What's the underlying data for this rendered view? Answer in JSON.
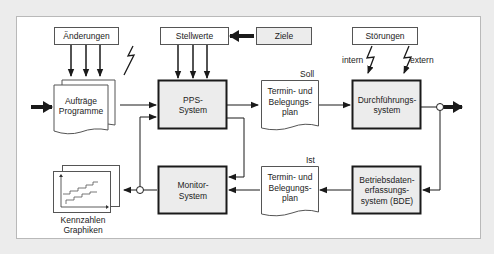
{
  "diagram": {
    "inputs": {
      "aenderungen": "Änderungen",
      "stellwerte": "Stellwerte",
      "ziele": "Ziele",
      "stoerungen": "Störungen"
    },
    "disturbance_labels": {
      "intern": "intern",
      "extern": "extern"
    },
    "nodes": {
      "auftraege": "Aufträge\nProgramme",
      "pps": "PPS-\nSystem",
      "plan_soll": "Termin- und\nBelegungs-\nplan",
      "durchfuehrung": "Durchführungs-\nsystem",
      "kennzahlen": "Kennzahlen\nGraphiken",
      "monitor": "Monitor-\nSystem",
      "plan_ist": "Termin- und\nBelegungs-\nplan",
      "bde": "Betriebsdaten-\nerfassungs-\nsystem (BDE)"
    },
    "tags": {
      "soll": "Soll",
      "ist": "Ist"
    },
    "colors": {
      "system_fill": "#ececec",
      "line": "#1a1a1a",
      "paper": "#ffffff"
    }
  }
}
